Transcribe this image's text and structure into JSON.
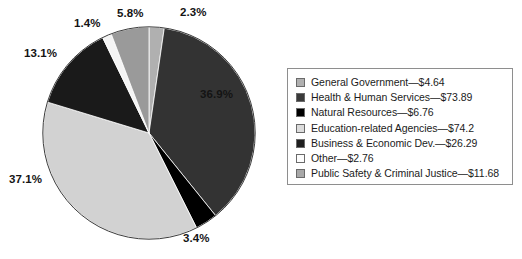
{
  "chart_data": {
    "type": "pie",
    "title": "",
    "subtitle": "",
    "xlabel": "",
    "ylabel": "",
    "grid": false,
    "legend_position": "right",
    "units": "billions of dollars",
    "total": 200.02,
    "start_angle_deg": 0,
    "direction": "clockwise",
    "categories": [
      "General Government",
      "Health & Human Services",
      "Natural Resources",
      "Education-related Agencies",
      "Business & Economic Dev.",
      "Other",
      "Public Safety & Criminal Justice"
    ],
    "values": [
      4.64,
      73.89,
      6.76,
      74.2,
      26.29,
      2.76,
      11.68
    ],
    "percent_labels": [
      "2.3%",
      "36.9%",
      "3.4%",
      "37.1%",
      "13.1%",
      "1.4%",
      "5.8%"
    ],
    "percentages": [
      2.3,
      36.9,
      3.4,
      37.1,
      13.1,
      1.4,
      5.8
    ],
    "colors": [
      "#b0b0b0",
      "#333333",
      "#000000",
      "#d2d2d2",
      "#1a1a1a",
      "#f4f4f4",
      "#9a9a9a"
    ],
    "slices": [
      {
        "name": "General Government",
        "value": 4.64,
        "percent": 2.3,
        "label": "2.3%",
        "color": "#b0b0b0",
        "swatch": "#b0b0b0"
      },
      {
        "name": "Health & Human Services",
        "value": 73.89,
        "percent": 36.9,
        "label": "36.9%",
        "color": "#333333",
        "swatch": "#3a3a3a"
      },
      {
        "name": "Natural Resources",
        "value": 6.76,
        "percent": 3.4,
        "label": "3.4%",
        "color": "#000000",
        "swatch": "#000000"
      },
      {
        "name": "Education-related Agencies",
        "value": 74.2,
        "percent": 37.1,
        "label": "37.1%",
        "color": "#d2d2d2",
        "swatch": "#dcdcdc"
      },
      {
        "name": "Business & Economic Dev.",
        "value": 26.29,
        "percent": 13.1,
        "label": "13.1%",
        "color": "#1a1a1a",
        "swatch": "#1f1f1f"
      },
      {
        "name": "Other",
        "value": 2.76,
        "percent": 1.4,
        "label": "1.4%",
        "color": "#f4f4f4",
        "swatch": "#fcfcfc"
      },
      {
        "name": "Public Safety & Criminal Justice",
        "value": 11.68,
        "percent": 5.8,
        "label": "5.8%",
        "color": "#9a9a9a",
        "swatch": "#a8a8a8"
      }
    ]
  },
  "pie": {
    "labels": {
      "pct_2_3": "2.3%",
      "pct_5_8": "5.8%",
      "pct_1_4": "1.4%",
      "pct_13_1": "13.1%",
      "pct_37_1": "37.1%",
      "pct_3_4": "3.4%",
      "pct_36_9": "36.9%"
    }
  },
  "legend": {
    "items": [
      {
        "label": "General Government—$4.64",
        "color": "#b0b0b0"
      },
      {
        "label": "Health & Human Services—$73.89",
        "color": "#3a3a3a"
      },
      {
        "label": "Natural Resources—$6.76",
        "color": "#000000"
      },
      {
        "label": "Education-related Agencies—$74.2",
        "color": "#dcdcdc"
      },
      {
        "label": "Business & Economic Dev.—$26.29",
        "color": "#1f1f1f"
      },
      {
        "label": "Other—$2.76",
        "color": "#fcfcfc"
      },
      {
        "label": "Public Safety & Criminal Justice—$11.68",
        "color": "#a8a8a8"
      }
    ]
  }
}
